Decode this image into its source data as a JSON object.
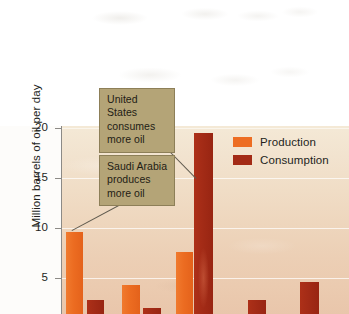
{
  "chart_data": {
    "type": "bar",
    "title": "",
    "xlabel": "",
    "ylabel": "Million barrels of oil per day",
    "ylim": [
      0,
      20
    ],
    "yticks": [
      5,
      10,
      15,
      20
    ],
    "grid": true,
    "legend_position": "top-right",
    "categories": [
      "Group 1",
      "Group 2",
      "Group 3",
      "Group 4",
      "Group 5"
    ],
    "note": "Bottom of figure is cropped; x-axis category labels are not visible in the image.",
    "series": [
      {
        "name": "Production",
        "color": "#ed6d23",
        "values": [
          9.6,
          4.3,
          7.6,
          null,
          null
        ]
      },
      {
        "name": "Consumption",
        "color": "#a32b16",
        "values": [
          2.8,
          2.0,
          19.5,
          2.8,
          4.6
        ]
      }
    ],
    "annotations": [
      {
        "text": "United States consumes more oil",
        "points_to": "Group 3 Consumption"
      },
      {
        "text": "Saudi Arabia produces more oil",
        "points_to": "Group 1 Production"
      }
    ]
  },
  "axis": {
    "y_title": "Million barrels of oil per day",
    "ticks": [
      {
        "label": "20",
        "value": 20
      },
      {
        "label": "15",
        "value": 15
      },
      {
        "label": "10",
        "value": 10
      },
      {
        "label": "5",
        "value": 5
      }
    ]
  },
  "legend": {
    "items": [
      {
        "label": "Production",
        "color": "#ed6d23"
      },
      {
        "label": "Consumption",
        "color": "#a32b16"
      }
    ]
  },
  "callouts": {
    "united_states": {
      "line1": "United States",
      "line2": "consumes",
      "line3": "more oil"
    },
    "saudi_arabia": {
      "line1": "Saudi Arabia",
      "line2": "produces",
      "line3": "more oil"
    }
  },
  "colors": {
    "production": "#ed6d23",
    "consumption": "#a32b16",
    "callout_bg": "#b4a477",
    "plot_bg_top": "#f4e9d6",
    "plot_bg_bottom": "#e9c6ab"
  }
}
